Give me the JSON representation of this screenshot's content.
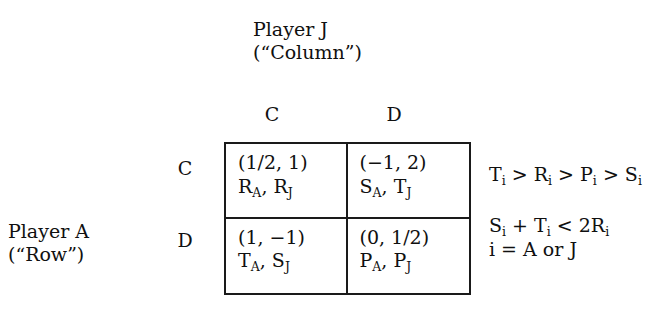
{
  "figure": {
    "type": "payoff-matrix",
    "column_player": {
      "name": "Player J",
      "role": "(“Column”)"
    },
    "row_player": {
      "name": "Player A",
      "role": "(“Row”)"
    },
    "column_headers": [
      "C",
      "D"
    ],
    "row_headers": [
      "C",
      "D"
    ],
    "cells": [
      {
        "row": "C",
        "col": "C",
        "payoff": "(1/2, 1)",
        "symbol_row": "R",
        "symbol_row_sub": "A",
        "symbol_sep": ", ",
        "symbol_col": "R",
        "symbol_col_sub": "J"
      },
      {
        "row": "C",
        "col": "D",
        "payoff": "(−1, 2)",
        "symbol_row": "S",
        "symbol_row_sub": "A",
        "symbol_sep": ", ",
        "symbol_col": "T",
        "symbol_col_sub": "J"
      },
      {
        "row": "D",
        "col": "C",
        "payoff": "(1, −1)",
        "symbol_row": "T",
        "symbol_row_sub": "A",
        "symbol_sep": ", ",
        "symbol_col": "S",
        "symbol_col_sub": "J"
      },
      {
        "row": "D",
        "col": "D",
        "payoff": "(0, 1/2)",
        "symbol_row": "P",
        "symbol_row_sub": "A",
        "symbol_sep": ", ",
        "symbol_col": "P",
        "symbol_col_sub": "J"
      }
    ],
    "conditions": {
      "ordering": {
        "terms": [
          "T",
          "R",
          "P",
          "S"
        ],
        "subscript": "i",
        "relation": " > "
      },
      "inequality": {
        "text_parts": [
          "S",
          " + ",
          "T",
          " < 2R"
        ],
        "subscript": "i"
      },
      "index_definition": "i = A or J"
    },
    "colors": {
      "ink": "#101010",
      "rule": "#1a1a1a",
      "background": "#ffffff"
    }
  },
  "chart_data": {
    "type": "table",
    "row_label": "Player A (“Row”)",
    "column_label": "Player J (“Column”)",
    "columns": [
      "C",
      "D"
    ],
    "rows": [
      "C",
      "D"
    ],
    "values": [
      [
        {
          "numeric": "(1/2, 1)",
          "symbolic": "R_A, R_J",
          "row_payoff": 0.5,
          "col_payoff": 1
        },
        {
          "numeric": "(−1, 2)",
          "symbolic": "S_A, T_J",
          "row_payoff": -1,
          "col_payoff": 2
        }
      ],
      [
        {
          "numeric": "(1, −1)",
          "symbolic": "T_A, S_J",
          "row_payoff": 1,
          "col_payoff": -1
        },
        {
          "numeric": "(0, 1/2)",
          "symbolic": "P_A, P_J",
          "row_payoff": 0,
          "col_payoff": 0.5
        }
      ]
    ],
    "annotations": [
      "T_i > R_i > P_i > S_i",
      "S_i + T_i < 2R_i",
      "i = A or J"
    ]
  }
}
